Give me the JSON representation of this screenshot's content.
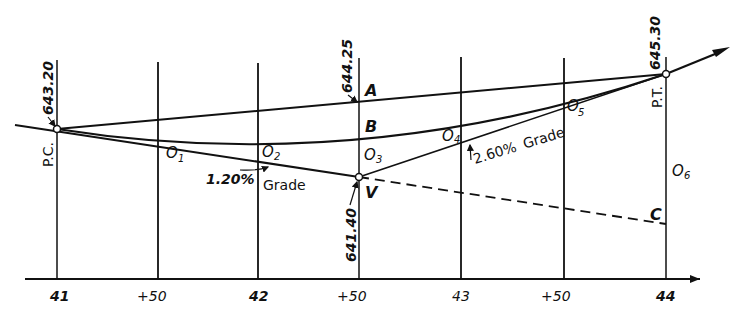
{
  "diagram": {
    "stations": [
      "41",
      "+50",
      "42",
      "+50",
      "43",
      "+50",
      "44"
    ],
    "points": {
      "pc": {
        "label": "P.C.",
        "elevation": "643.20"
      },
      "vertex": {
        "label": "V",
        "elevation": "641.40"
      },
      "pt": {
        "label": "P.T.",
        "elevation": "645.30"
      },
      "a": {
        "label": "A",
        "elevation": "644.25"
      },
      "b": {
        "label": "B"
      },
      "c": {
        "label": "C"
      }
    },
    "offsets": [
      "O",
      "O",
      "O",
      "O",
      "O",
      "O"
    ],
    "offset_subs": [
      "1",
      "2",
      "3",
      "4",
      "5",
      "6"
    ],
    "grades": {
      "back": {
        "value": "1.20%",
        "word": "Grade"
      },
      "forward": {
        "value": "2.60%",
        "word": "Grade"
      }
    }
  }
}
